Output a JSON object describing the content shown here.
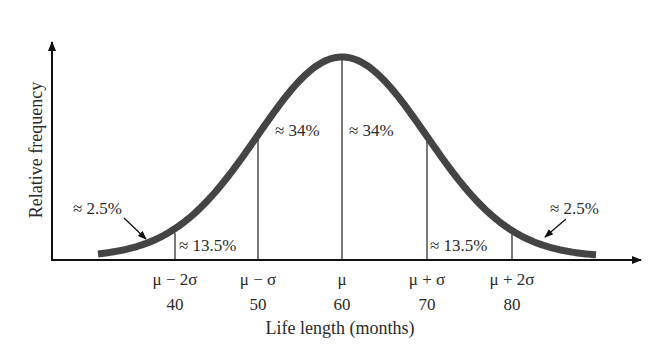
{
  "chart_data": {
    "type": "line",
    "title": "",
    "xlabel": "Life length (months)",
    "ylabel": "Relative frequency",
    "mean": 60,
    "std": 10,
    "x_ticks": [
      {
        "symbol": "μ − 2σ",
        "value": "40"
      },
      {
        "symbol": "μ − σ",
        "value": "50"
      },
      {
        "symbol": "μ",
        "value": "60"
      },
      {
        "symbol": "μ + σ",
        "value": "70"
      },
      {
        "symbol": "μ + 2σ",
        "value": "80"
      }
    ],
    "regions": [
      {
        "range": "< 40",
        "label": "≈ 2.5%"
      },
      {
        "range": "40–50",
        "label": "≈ 13.5%"
      },
      {
        "range": "50–60",
        "label": "≈ 34%"
      },
      {
        "range": "60–70",
        "label": "≈ 34%"
      },
      {
        "range": "70–80",
        "label": "≈ 13.5%"
      },
      {
        "range": "> 80",
        "label": "≈ 2.5%"
      }
    ],
    "grid": false,
    "legend": null,
    "colors": {
      "curve": "#444444",
      "axes": "#111111",
      "lines": "#222222"
    }
  }
}
